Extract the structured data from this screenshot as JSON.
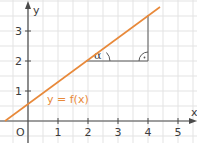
{
  "chart_data": {
    "type": "line",
    "title": "",
    "xlabel": "x",
    "ylabel": "y",
    "x_ticks": [
      "1",
      "2",
      "3",
      "4",
      "5"
    ],
    "y_ticks": [
      "1",
      "2",
      "3"
    ],
    "origin_label": "O",
    "xlim": [
      -0.9,
      5.6
    ],
    "ylim": [
      -0.7,
      4.0
    ],
    "grid": true,
    "grid_step": 0.5,
    "series": [
      {
        "name": "y = f(x)",
        "color": "#e8893a",
        "x": [
          -0.77,
          4.4
        ],
        "y": [
          0.0,
          3.8
        ],
        "slope": 0.74,
        "intercept": 0.57
      }
    ],
    "annotations": {
      "slope_triangle": {
        "horizontal_leg": {
          "from_x": 1.93,
          "to_x": 4.0,
          "y": 2.0
        },
        "vertical_leg": {
          "x": 4.0,
          "from_y": 2.0,
          "to_y": 3.53
        },
        "angle_label": "α",
        "right_angle_mark": "·"
      },
      "function_label": "y = f(x)"
    }
  },
  "colors": {
    "line": "#e8893a",
    "axis": "#4a4a4a",
    "grid": "#e3e3e3",
    "triangle": "#5a5a5a"
  }
}
